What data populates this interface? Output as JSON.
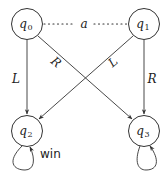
{
  "diagram": {
    "type": "state-graph",
    "nodes": [
      {
        "id": "q0",
        "label": "q",
        "subscript": "0"
      },
      {
        "id": "q1",
        "label": "q",
        "subscript": "1"
      },
      {
        "id": "q2",
        "label": "q",
        "subscript": "2"
      },
      {
        "id": "q3",
        "label": "q",
        "subscript": "3"
      }
    ],
    "edges": [
      {
        "from": "q0",
        "to": "q1",
        "label": "a",
        "style": "dotted"
      },
      {
        "from": "q0",
        "to": "q2",
        "label": "L",
        "style": "solid-arrow"
      },
      {
        "from": "q0",
        "to": "q3",
        "label": "R",
        "style": "solid-arrow"
      },
      {
        "from": "q1",
        "to": "q2",
        "label": "L",
        "style": "solid-arrow"
      },
      {
        "from": "q1",
        "to": "q3",
        "label": "R",
        "style": "solid-arrow"
      },
      {
        "from": "q2",
        "to": "q2",
        "label": "",
        "style": "self-loop"
      },
      {
        "from": "q3",
        "to": "q3",
        "label": "",
        "style": "self-loop"
      }
    ],
    "annotations": {
      "q2_win": "win"
    }
  }
}
